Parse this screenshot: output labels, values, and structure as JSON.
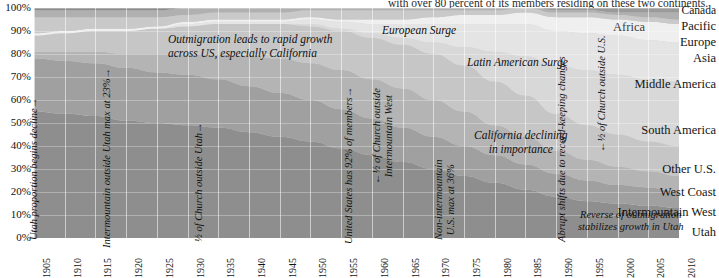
{
  "caption": {
    "top_clipped": "with over 80 percent of its members residing on these two continents."
  },
  "axes": {
    "y_ticks": [
      "100%",
      "90%",
      "80%",
      "70%",
      "60%",
      "50%",
      "40%",
      "30%",
      "20%",
      "10%",
      "0%"
    ],
    "x_ticks": [
      "1905",
      "1910",
      "1915",
      "1920",
      "1925",
      "1930",
      "1935",
      "1940",
      "1945",
      "1950",
      "1955",
      "1960",
      "1965",
      "1970",
      "1975",
      "1980",
      "1985",
      "1990",
      "1995",
      "2000",
      "2005",
      "2010"
    ]
  },
  "series_labels": [
    {
      "label": "Canada",
      "kind": "right"
    },
    {
      "label": "Pacific",
      "kind": "right"
    },
    {
      "label": "Europe",
      "kind": "right"
    },
    {
      "label": "Asia",
      "kind": "right"
    },
    {
      "label": "Africa",
      "kind": "right-inset"
    },
    {
      "label": "Middle America",
      "kind": "right"
    },
    {
      "label": "South America",
      "kind": "right"
    },
    {
      "label": "Other U.S.",
      "kind": "right"
    },
    {
      "label": "West Coast",
      "kind": "right"
    },
    {
      "label": "Intermountain West",
      "kind": "right"
    },
    {
      "label": "Utah",
      "kind": "right"
    }
  ],
  "annotations": [
    {
      "id": "utah-decline",
      "text": "Utah proportion begins decline",
      "orientation": "vertical"
    },
    {
      "id": "intermountain-max",
      "text": "Intermountain outside Utah max at 23%",
      "orientation": "vertical"
    },
    {
      "id": "half-outside-utah",
      "text": "½ of Church outside Utah",
      "orientation": "vertical"
    },
    {
      "id": "outmigration",
      "line1": "Outmigration leads to rapid growth",
      "line2": "across US, especially California",
      "orientation": "horizontal"
    },
    {
      "id": "us-92",
      "text": "United States has 92% of members",
      "orientation": "vertical"
    },
    {
      "id": "european-surge",
      "text": "European Surge",
      "orientation": "horizontal"
    },
    {
      "id": "half-outside-intermountain",
      "line1": "½ of Church outside",
      "line2": "Intermountain West",
      "orientation": "vertical"
    },
    {
      "id": "non-intermountain-max",
      "line1": "Non-intermountain",
      "line2": "U.S. max at 36%",
      "orientation": "vertical"
    },
    {
      "id": "latin-american-surge",
      "text": "Latin American Surge",
      "orientation": "horizontal"
    },
    {
      "id": "california-declining",
      "line1": "California declining",
      "line2": "in importance",
      "orientation": "horizontal"
    },
    {
      "id": "abrupt-shifts",
      "text": "Abrupt shifts due to record-keeping changes",
      "orientation": "vertical"
    },
    {
      "id": "half-outside-us",
      "text": "½ of Church outside U.S.",
      "orientation": "vertical"
    },
    {
      "id": "reverse-outmigration",
      "line1": "Reverse of outmigration",
      "line2": "stabilizes growth in Utah",
      "orientation": "horizontal"
    }
  ],
  "chart_data": {
    "type": "area",
    "title": "",
    "xlabel": "",
    "ylabel": "",
    "stacked": true,
    "normalized": true,
    "ylim": [
      0,
      100
    ],
    "xlim": [
      1905,
      2010
    ],
    "grid": true,
    "legend_position": "right-inline",
    "x": [
      1905,
      1910,
      1915,
      1920,
      1925,
      1930,
      1935,
      1940,
      1945,
      1950,
      1955,
      1960,
      1965,
      1970,
      1975,
      1980,
      1985,
      1990,
      1995,
      2000,
      2005,
      2010
    ],
    "series": [
      {
        "name": "Utah",
        "color": "#8e8e8e",
        "values": [
          55,
          54,
          53,
          51,
          50,
          49,
          48,
          46,
          44,
          42,
          39,
          36,
          33,
          30,
          27,
          24,
          21,
          18,
          16,
          15,
          14,
          13
        ]
      },
      {
        "name": "Intermountain West",
        "color": "#a0a0a0",
        "values": [
          23,
          23,
          23,
          23,
          22,
          22,
          21,
          20,
          19,
          18,
          17,
          16,
          15,
          14,
          13,
          12,
          11,
          10,
          9,
          8,
          8,
          7
        ]
      },
      {
        "name": "West Coast",
        "color": "#b4b4b4",
        "values": [
          3,
          4,
          5,
          6,
          8,
          9,
          11,
          13,
          15,
          16,
          17,
          17,
          17,
          16,
          15,
          13,
          12,
          10,
          9,
          8,
          7,
          7
        ]
      },
      {
        "name": "Other U.S.",
        "color": "#c6c6c6",
        "values": [
          7,
          8,
          9,
          10,
          11,
          12,
          13,
          14,
          15,
          16,
          17,
          18,
          19,
          20,
          20,
          19,
          18,
          16,
          15,
          14,
          13,
          13
        ]
      },
      {
        "name": "South America",
        "color": "#d8d8d8",
        "values": [
          0,
          0,
          0,
          0,
          0,
          0,
          0,
          0,
          0,
          1,
          1,
          2,
          3,
          5,
          8,
          13,
          17,
          21,
          24,
          26,
          27,
          28
        ]
      },
      {
        "name": "Middle America",
        "color": "#e4e4e4",
        "values": [
          0,
          0,
          0,
          0,
          0,
          1,
          1,
          1,
          1,
          2,
          3,
          4,
          6,
          8,
          10,
          12,
          14,
          15,
          16,
          17,
          17,
          17
        ]
      },
      {
        "name": "Asia",
        "color": "#efefef",
        "values": [
          1,
          1,
          1,
          1,
          1,
          1,
          1,
          1,
          1,
          1,
          1,
          2,
          2,
          3,
          4,
          4,
          5,
          6,
          7,
          7,
          8,
          8
        ]
      },
      {
        "name": "Europe",
        "color": "#c9c9c9",
        "values": [
          7,
          6,
          5,
          5,
          4,
          3,
          3,
          3,
          3,
          3,
          4,
          4,
          4,
          3,
          2,
          2,
          2,
          2,
          2,
          2,
          2,
          2
        ]
      },
      {
        "name": "Pacific",
        "color": "#b0b0b0",
        "values": [
          3,
          3,
          3,
          3,
          3,
          3,
          2,
          2,
          2,
          2,
          1,
          1,
          1,
          1,
          1,
          1,
          1,
          1,
          1,
          1,
          2,
          3
        ]
      },
      {
        "name": "Africa",
        "color": "#9a9a9a",
        "values": [
          0,
          0,
          0,
          0,
          0,
          0,
          0,
          0,
          0,
          0,
          0,
          0,
          0,
          0,
          0,
          0,
          0,
          1,
          1,
          2,
          2,
          2
        ]
      },
      {
        "name": "Canada",
        "color": "#8a8a8a",
        "values": [
          1,
          1,
          1,
          1,
          1,
          1,
          1,
          1,
          1,
          1,
          1,
          1,
          1,
          1,
          1,
          1,
          1,
          1,
          1,
          1,
          1,
          1
        ]
      }
    ]
  }
}
